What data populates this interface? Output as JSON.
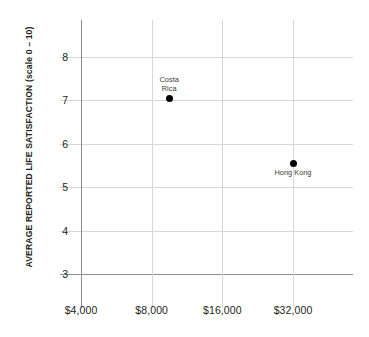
{
  "chart_data": {
    "type": "scatter",
    "title": "",
    "subtitle": "",
    "xlabel": "",
    "ylabel": "AVERAGE REPORTED LIFE SATISFACTION (scale 0 – 10)",
    "x_scale": "log2",
    "x_tick_labels": [
      "$4,000",
      "$8,000",
      "$16,000",
      "$32,000"
    ],
    "x_tick_values": [
      4000,
      8000,
      16000,
      32000
    ],
    "y_tick_labels": [
      "8",
      "7",
      "6",
      "5",
      "4",
      "3"
    ],
    "y_tick_values": [
      8,
      7,
      6,
      5,
      4,
      3
    ],
    "ylim": [
      3,
      8.6
    ],
    "xlim": [
      4000,
      32000
    ],
    "grid": true,
    "legend": "none",
    "point_color": "#000000",
    "grid_color": "#d4d6d8",
    "axis_color": "#8e9194",
    "text_color": "#231f20",
    "background": "#ffffff",
    "points": [
      {
        "name": "Costa Rica",
        "label": "Costa\nRica",
        "label_position": "above",
        "x": 9500,
        "y": 7.05
      },
      {
        "name": "Hong Kong",
        "label": "Hong Kong",
        "label_position": "below",
        "x": 32000,
        "y": 5.55
      }
    ]
  }
}
